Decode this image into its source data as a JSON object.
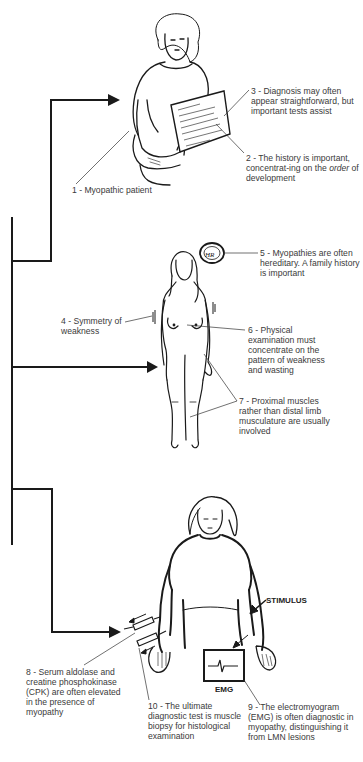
{
  "diagram": {
    "type": "flow-illustration",
    "flow_branches": [
      {
        "id": "history",
        "target": "seated-patient"
      },
      {
        "id": "examination",
        "target": "standing-patient"
      },
      {
        "id": "tests",
        "target": "tests-patient"
      }
    ],
    "labels": {
      "l1": "1 - Myopathic patient",
      "l2_a": "2 - The history is important, concentrat-ing on the ",
      "l2_em": "order",
      "l2_b": " of development",
      "l3": "3 - Diagnosis may often appear straightforward, but important tests assist",
      "l4": "4 - Symmetry of weakness",
      "l5": "5 - Myopathies are often hereditary. A family history is important",
      "l6": "6 - Physical examination must concentrate on the pattern of weakness and wasting",
      "l7": "7 - Proximal muscles rather than distal limb musculature are usually involved",
      "l8": "8 - Serum aldolase and creatine phosphokinase (CPK) are often elevated in the presence of myopathy",
      "l9": "9 - The electromyogram (EMG) is often diagnostic in myopathy, distinguishing it from LMN lesions",
      "l10": "10 - The ultimate diagnostic test is muscle biopsy for histological examination"
    },
    "device_labels": {
      "stimulus": "STIMULUS",
      "emg": "EMG"
    },
    "colors": {
      "line": "#1a1a1a",
      "text": "#3a3a3a",
      "background": "#ffffff"
    }
  }
}
